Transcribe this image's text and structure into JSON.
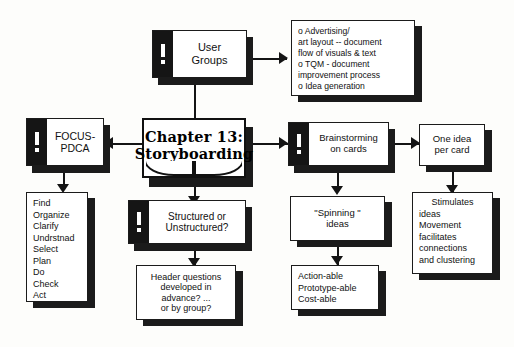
{
  "diagram": {
    "title": "Chapter 13: Storyboarding",
    "nodes": {
      "center": {
        "line1": "Chapter 13:",
        "line2": "Storyboarding"
      },
      "user_groups": {
        "label": "User\nGroups",
        "icon": "warning-exclamation-icon"
      },
      "uses_list": {
        "lines": [
          "o  Advertising/",
          "art layout -- document",
          "flow of visuals & text",
          "o  TQM - document",
          "improvement process",
          "o  Idea generation"
        ]
      },
      "focus_pdca": {
        "label": "FOCUS-\nPDCA",
        "icon": "warning-exclamation-icon"
      },
      "focus_steps": {
        "lines": [
          "Find",
          "Organize",
          "Clarify",
          "Undrstnad",
          "Select",
          "Plan",
          "Do",
          "Check",
          "Act"
        ]
      },
      "structured": {
        "label": "Structured or\nUnstructured?",
        "icon": "warning-exclamation-icon"
      },
      "header_questions": {
        "lines": [
          "Header questions",
          "developed in",
          "advance?  ...",
          "or by group?"
        ]
      },
      "brainstorming": {
        "label": "Brainstorming\non cards",
        "icon": "warning-exclamation-icon"
      },
      "one_idea": {
        "label": "One idea\nper card"
      },
      "spinning": {
        "label": "\"Spinning \"\nideas"
      },
      "able_list": {
        "lines": [
          "Action-able",
          "Prototype-able",
          "Cost-able"
        ]
      },
      "stimulates": {
        "lines": [
          "Stimulates",
          "ideas",
          "Movement",
          "facilitates",
          "connections",
          "and clustering"
        ]
      }
    },
    "colors": {
      "ink": "#141414",
      "paper": "#fdfdfb",
      "card_fill": "#ffffff",
      "icon_tab": "#151515"
    }
  }
}
